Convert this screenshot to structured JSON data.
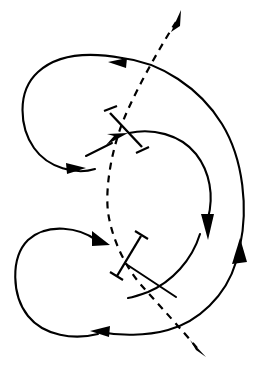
{
  "figure": {
    "title": "",
    "caption": "",
    "background_color": "#ffffff",
    "stroke_color": "#000000",
    "width": 254,
    "height": 373
  },
  "chart_data": {
    "type": "diagram",
    "title": "",
    "xlabel": "",
    "ylabel": "",
    "legend": [],
    "annotations": [],
    "elements": [
      {
        "id": "upper-left-loop",
        "kind": "curve",
        "style": "solid",
        "direction": "clockwise",
        "arrowheads": 2,
        "arrow_points": [
          "left",
          "right"
        ],
        "extent": {
          "x_min": 20,
          "x_max": 125,
          "y_min": 55,
          "y_max": 172
        }
      },
      {
        "id": "lower-left-loop",
        "kind": "curve",
        "style": "solid",
        "direction": "counterclockwise",
        "arrowheads": 2,
        "arrow_points": [
          "down-right",
          "left"
        ],
        "extent": {
          "x_min": 14,
          "x_max": 150,
          "y_min": 228,
          "y_max": 337
        }
      },
      {
        "id": "outer-right-arc",
        "kind": "curve",
        "style": "solid",
        "direction": "upward",
        "arrowheads": 1,
        "arrow_points": [
          "up"
        ],
        "extent": {
          "x_min": 120,
          "x_max": 246,
          "y_min": 58,
          "y_max": 330
        }
      },
      {
        "id": "inner-right-arc",
        "kind": "curve",
        "style": "solid",
        "direction": "downward",
        "arrowheads": 1,
        "arrow_points": [
          "down"
        ],
        "extent": {
          "x_min": 128,
          "x_max": 216,
          "y_min": 132,
          "y_max": 300
        }
      },
      {
        "id": "dashed-trajectory",
        "kind": "curve",
        "style": "dashed",
        "direction": "bidirectional",
        "arrowheads": 2,
        "arrow_points": [
          "up-right",
          "down-right"
        ],
        "extent": {
          "x_min": 105,
          "x_max": 205,
          "y_min": 10,
          "y_max": 357
        }
      },
      {
        "id": "upper-barbell",
        "kind": "barbell",
        "style": "solid",
        "orientation": "nw-se",
        "p1": {
          "x": 110,
          "y": 112
        },
        "p2": {
          "x": 141,
          "y": 146
        }
      },
      {
        "id": "lower-barbell",
        "kind": "barbell",
        "style": "solid",
        "orientation": "ne-sw",
        "p1": {
          "x": 141,
          "y": 235
        },
        "p2": {
          "x": 116,
          "y": 276
        }
      }
    ]
  }
}
